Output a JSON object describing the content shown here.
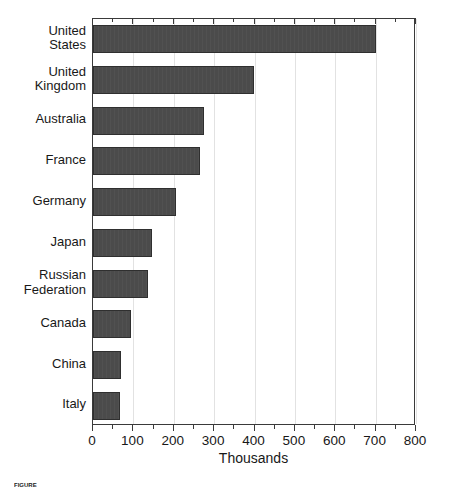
{
  "chart_data": {
    "type": "bar",
    "orientation": "horizontal",
    "title": "",
    "xlabel": "Thousands",
    "ylabel": "",
    "xlim": [
      0,
      800
    ],
    "xticks": [
      0,
      100,
      200,
      300,
      400,
      500,
      600,
      700,
      800
    ],
    "xtick_labels": [
      "0",
      "100",
      "200",
      "300",
      "400",
      "500",
      "600",
      "700",
      "800"
    ],
    "minor_tick_step": 50,
    "grid": true,
    "grid_axis": "x",
    "legend": false,
    "bar_color": "#4b4b4b",
    "categories": [
      "United States",
      "United Kingdom",
      "Australia",
      "France",
      "Germany",
      "Japan",
      "Russian Federation",
      "Canada",
      "China",
      "Italy"
    ],
    "category_lines": [
      [
        "United",
        "States"
      ],
      [
        "United",
        "Kingdom"
      ],
      [
        "Australia"
      ],
      [
        "France"
      ],
      [
        "Germany"
      ],
      [
        "Japan"
      ],
      [
        "Russian",
        "Federation"
      ],
      [
        "Canada"
      ],
      [
        "China"
      ],
      [
        "Italy"
      ]
    ],
    "values": [
      700,
      398,
      275,
      265,
      205,
      145,
      135,
      95,
      70,
      68
    ]
  },
  "caption": {
    "label": "FIGURE",
    "text": ""
  }
}
